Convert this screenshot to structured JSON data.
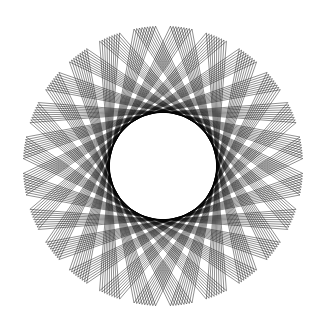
{
  "figure": {
    "background": "#ffffff",
    "stroke_color": "#000000"
  },
  "pattern": {
    "center": [
      163,
      166
    ],
    "outer_radius": 140,
    "inner_radius": 50,
    "points": 24,
    "step": 9,
    "lines_per_band": 9,
    "band_spread": 10,
    "rotation_deg": 7.5
  }
}
